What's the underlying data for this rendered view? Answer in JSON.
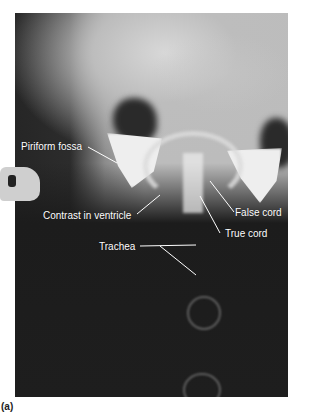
{
  "figure": {
    "caption": "(a)",
    "image_type": "laryngeal radiograph with contrast",
    "labels": [
      {
        "text": "Piriform fossa"
      },
      {
        "text": "Contrast in ventricle"
      },
      {
        "text": "False cord"
      },
      {
        "text": "True cord"
      },
      {
        "text": "Trachea"
      }
    ],
    "film_marker": "P"
  }
}
